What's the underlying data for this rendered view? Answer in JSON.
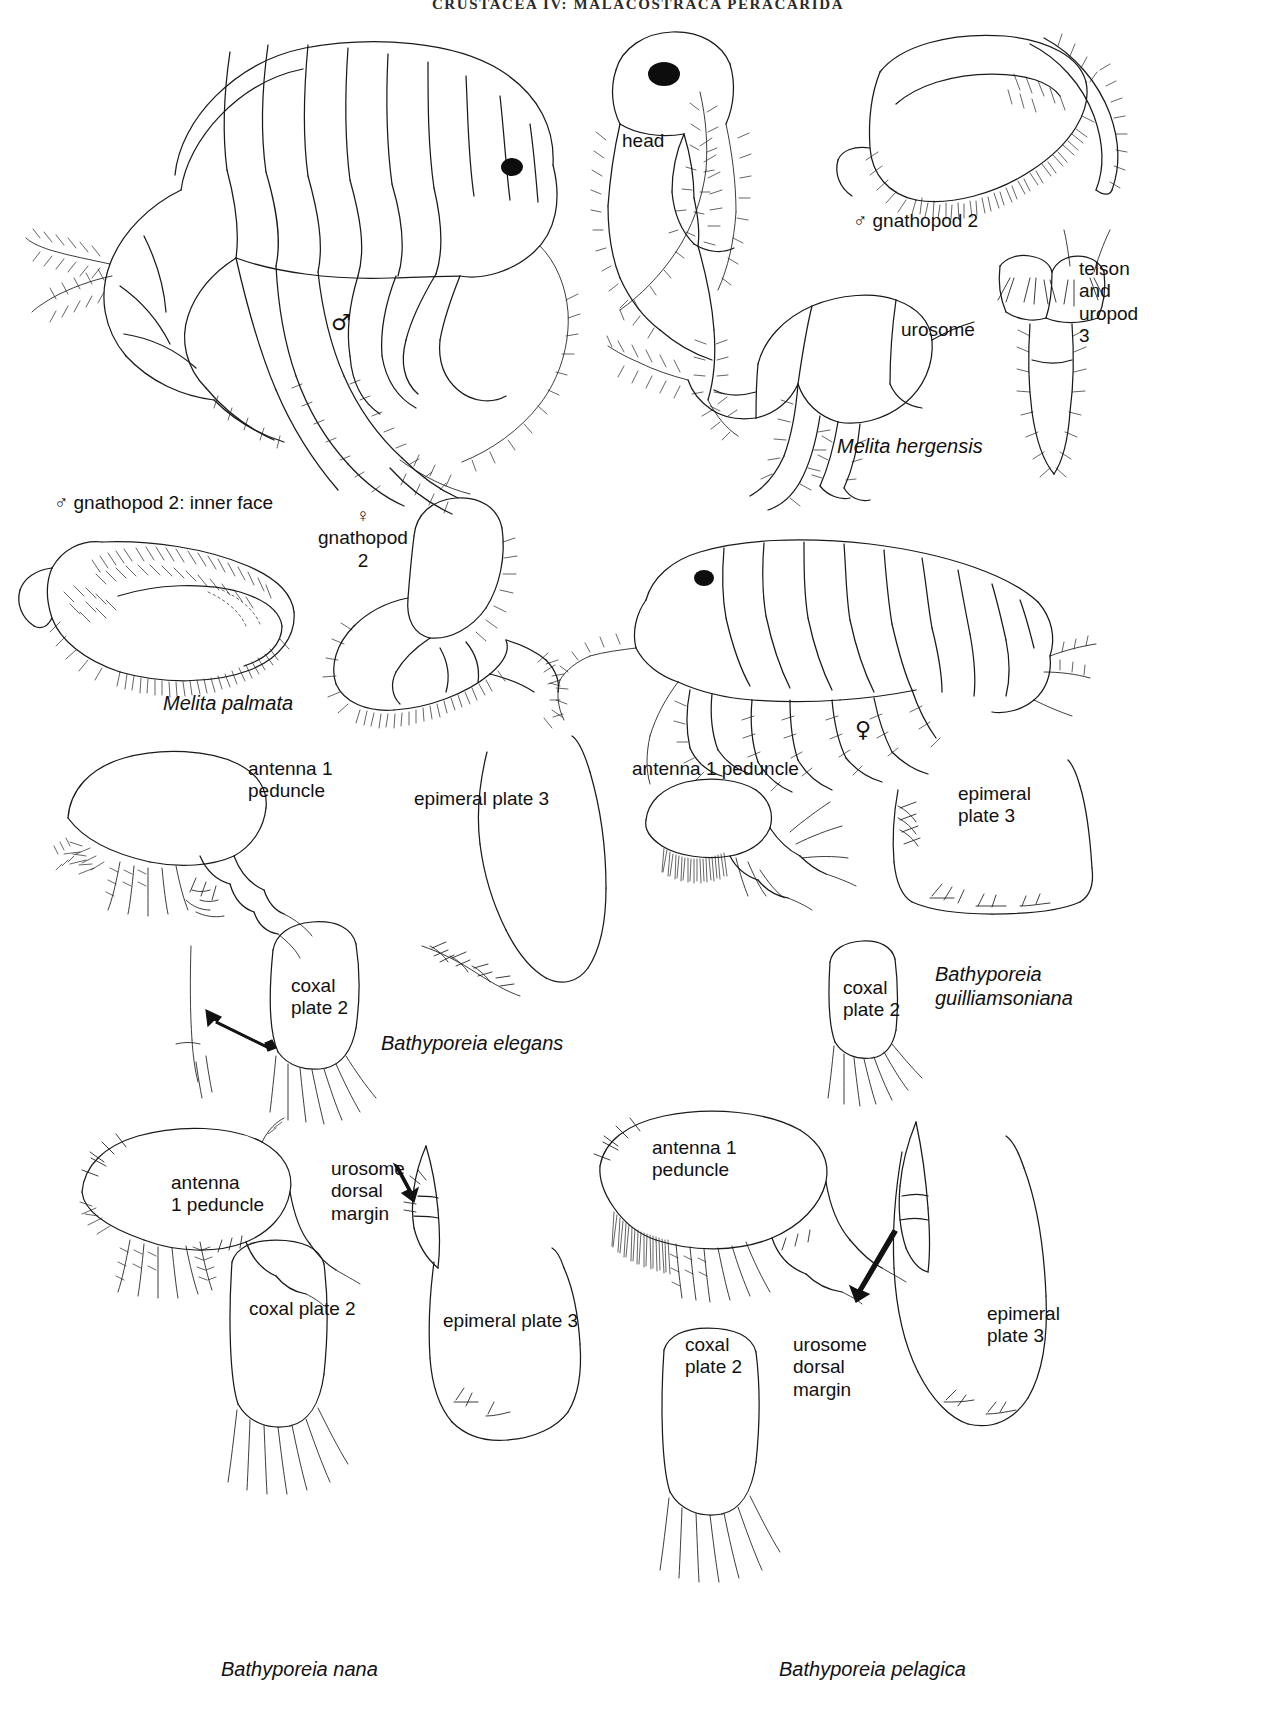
{
  "page": {
    "running_head": "CRUSTACEA IV: MALACOSTRACA PERACARIDA",
    "width": 1276,
    "height": 1709,
    "background": "#ffffff",
    "ink_color": "#1a1a1a"
  },
  "symbols": {
    "male": "♂",
    "female": "♀"
  },
  "figures": [
    {
      "id": "melita-hergensis-male-habitus",
      "species": null,
      "labels": [],
      "sex_marker": "♂",
      "sex_marker_pos": {
        "x": 336,
        "y": 322
      }
    }
  ],
  "labels": [
    {
      "name": "head",
      "text": "head",
      "x": 622,
      "y": 130,
      "kind": "part"
    },
    {
      "name": "male-gnathopod-2",
      "text": "♂ gnathopod 2",
      "x": 853,
      "y": 210,
      "kind": "part"
    },
    {
      "name": "telson-and-uropod-3",
      "text": "telson\nand\nuropod\n3",
      "x": 1079,
      "y": 258,
      "kind": "part"
    },
    {
      "name": "urosome",
      "text": "urosome",
      "x": 901,
      "y": 319,
      "kind": "part"
    },
    {
      "name": "male-gnathopod-2-inner",
      "text": "♂ gnathopod 2: inner face",
      "x": 54,
      "y": 492,
      "kind": "part"
    },
    {
      "name": "female-gnathopod-2",
      "text": "♀\ngnathopod\n2",
      "x": 318,
      "y": 505,
      "kind": "part"
    },
    {
      "name": "antenna-1-peduncle-elegans",
      "text": "antenna 1\npeduncle",
      "x": 248,
      "y": 758,
      "kind": "part"
    },
    {
      "name": "epimeral-plate-3-elegans",
      "text": "epimeral plate 3",
      "x": 414,
      "y": 788,
      "kind": "part"
    },
    {
      "name": "coxal-plate-2-elegans",
      "text": "coxal\nplate 2",
      "x": 291,
      "y": 975,
      "kind": "part"
    },
    {
      "name": "antenna-1-peduncle-guill",
      "text": "antenna 1 peduncle",
      "x": 632,
      "y": 758,
      "kind": "part"
    },
    {
      "name": "epimeral-plate-3-guill",
      "text": "epimeral\nplate 3",
      "x": 958,
      "y": 783,
      "kind": "part"
    },
    {
      "name": "coxal-plate-2-guill",
      "text": "coxal\nplate 2",
      "x": 843,
      "y": 977,
      "kind": "part"
    },
    {
      "name": "antenna-1-peduncle-nana",
      "text": "antenna\n1 peduncle",
      "x": 171,
      "y": 1172,
      "kind": "part"
    },
    {
      "name": "urosome-dorsal-margin-nana",
      "text": "urosome\ndorsal\nmargin",
      "x": 331,
      "y": 1158,
      "kind": "part"
    },
    {
      "name": "coxal-plate-2-nana",
      "text": "coxal plate 2",
      "x": 249,
      "y": 1298,
      "kind": "part"
    },
    {
      "name": "epimeral-plate-3-nana",
      "text": "epimeral plate 3",
      "x": 443,
      "y": 1310,
      "kind": "part"
    },
    {
      "name": "antenna-1-peduncle-pelagica",
      "text": "antenna 1\npeduncle",
      "x": 652,
      "y": 1137,
      "kind": "part"
    },
    {
      "name": "urosome-dorsal-margin-pelagica",
      "text": "urosome\ndorsal\nmargin",
      "x": 793,
      "y": 1334,
      "kind": "part"
    },
    {
      "name": "coxal-plate-2-pelagica",
      "text": "coxal\nplate 2",
      "x": 685,
      "y": 1334,
      "kind": "part"
    },
    {
      "name": "epimeral-plate-3-pelagica",
      "text": "epimeral\nplate 3",
      "x": 987,
      "y": 1303,
      "kind": "part"
    }
  ],
  "species_labels": [
    {
      "name": "melita-hergensis",
      "text": "Melita hergensis",
      "x": 837,
      "y": 435
    },
    {
      "name": "melita-palmata",
      "text": "Melita palmata",
      "x": 163,
      "y": 692
    },
    {
      "name": "bathyporeia-elegans",
      "text": "Bathyporeia elegans",
      "x": 381,
      "y": 1032
    },
    {
      "name": "bathyporeia-guilliamsoniana",
      "text": "Bathyporeia\nguilliamsoniana",
      "x": 935,
      "y": 963
    },
    {
      "name": "bathyporeia-nana",
      "text": "Bathyporeia nana",
      "x": 221,
      "y": 1658
    },
    {
      "name": "bathyporeia-pelagica",
      "text": "Bathyporeia pelagica",
      "x": 779,
      "y": 1658
    }
  ],
  "sex_markers": [
    {
      "name": "male-marker-habitus",
      "text": "♂",
      "x": 331,
      "y": 310
    },
    {
      "name": "female-marker-habitus",
      "text": "♀",
      "x": 855,
      "y": 717
    }
  ]
}
